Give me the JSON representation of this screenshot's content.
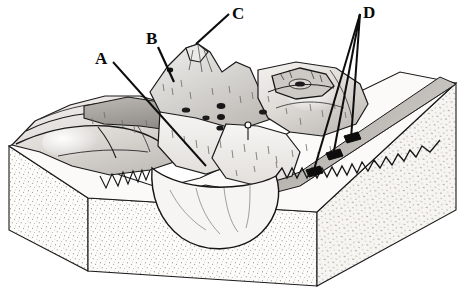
{
  "figure": {
    "kind": "geologic-block-diagram",
    "header_text": "",
    "background_color": "#ffffff",
    "ink_color": "#111111",
    "palette": {
      "ink": "#141414",
      "paper": "#ffffff",
      "highland_light": "#f2f0ee",
      "highland_mid": "#d8d5d1",
      "highland_dark": "#b3afab",
      "ridge_shadow": "#9a9691",
      "valley_fill": "#e8e5e2",
      "stipple_block": "#fbfaf8",
      "stipple_dot": "#8c8880",
      "dark_feature": "#1c1c1c"
    }
  },
  "labels": [
    {
      "id": "A",
      "text": "A",
      "x": 95,
      "y": 50,
      "leader": {
        "from_x": 113,
        "from_y": 62,
        "to_x": 206,
        "to_y": 166
      }
    },
    {
      "id": "B",
      "text": "B",
      "x": 146,
      "y": 30,
      "leader": {
        "from_x": 158,
        "from_y": 47,
        "to_x": 174,
        "to_y": 82
      }
    },
    {
      "id": "C",
      "text": "C",
      "x": 232,
      "y": 5,
      "leader": {
        "from_x": 229,
        "from_y": 14,
        "to_x": 196,
        "to_y": 44
      }
    },
    {
      "id": "D",
      "text": "D",
      "x": 363,
      "y": 4,
      "leaders": [
        {
          "from_x": 360,
          "from_y": 14,
          "to_x": 313,
          "to_y": 173
        },
        {
          "from_x": 360,
          "from_y": 14,
          "to_x": 333,
          "to_y": 156
        },
        {
          "from_x": 360,
          "from_y": 14,
          "to_x": 351,
          "to_y": 139
        }
      ]
    }
  ],
  "features": {
    "block_base": "stippled sediment block",
    "surface": "eroded glaciated highland with cirques, aretes, horns and U-shaped valleys",
    "right_foreground": "outwash / valley train plain sloping to lower right",
    "dark_spots": "tarns and exposed bedrock knobs"
  },
  "canvas": {
    "width": 467,
    "height": 292
  }
}
